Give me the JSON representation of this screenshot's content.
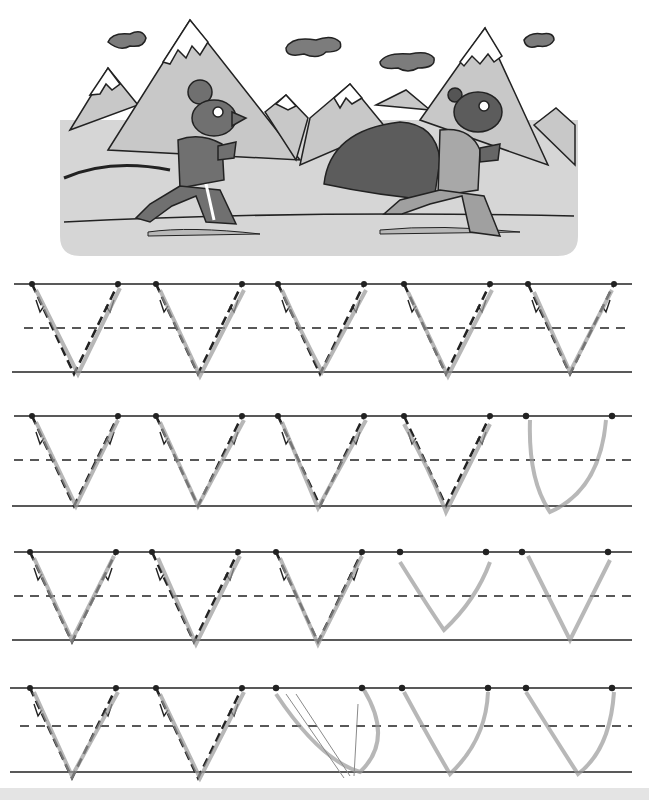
{
  "worksheet": {
    "type": "letter-tracing-practice",
    "letter": "V",
    "illustration": {
      "description": "Two cartoon mice in tracksuits running in front of snowy mountains",
      "characters": [
        "mouse-runner-left",
        "mouse-runner-right-with-cape"
      ],
      "background_elements": [
        "mountains",
        "clouds",
        "ground"
      ]
    },
    "rows": [
      {
        "index": 1,
        "guide_letters": 5,
        "dashed_guides": [
          true,
          true,
          true,
          true,
          true
        ]
      },
      {
        "index": 2,
        "guide_letters": 5,
        "dashed_guides": [
          true,
          true,
          true,
          true,
          false
        ]
      },
      {
        "index": 3,
        "guide_letters": 5,
        "dashed_guides": [
          true,
          true,
          true,
          false,
          false
        ]
      },
      {
        "index": 4,
        "guide_letters": 5,
        "dashed_guides": [
          true,
          true,
          false,
          false,
          false
        ]
      }
    ],
    "colors": {
      "line": "#222222",
      "sky_panel": "#d4d4d4",
      "mountain": "#c8c8c8",
      "snow": "#ffffff",
      "character": "#6e6e6e",
      "cloud": "#7a7a7a",
      "pencil": "#9a9a9a"
    }
  }
}
